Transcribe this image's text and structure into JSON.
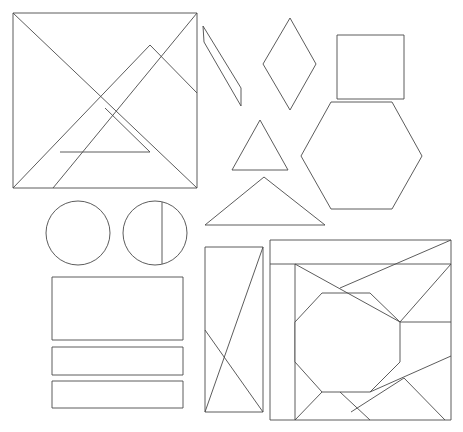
{
  "figure": {
    "width": 463,
    "height": 432,
    "background_color": "#ffffff",
    "stroke_color": "#4a4a4a",
    "stroke_color_light": "#8d8d8d",
    "stroke_width": 0.9,
    "shape_count": 13
  },
  "shapes": [
    {
      "id": "tangram-square",
      "name": "tangram-square",
      "label": "Tangram square",
      "type": "polygon-dissection",
      "outline": "13,13 197,13 197,188 13,188",
      "cuts": [
        "13,13 197,188",
        "197,13 53,188",
        "13,188 150,45",
        "150,45 197,93",
        "60,152 150,152",
        "105,108 150,152"
      ]
    },
    {
      "id": "thin-parallelogram",
      "name": "thin-parallelogram",
      "label": "Thin parallelogram",
      "type": "polygon",
      "outline": "203,26 241,88 241,106 204,42"
    },
    {
      "id": "rhombus",
      "name": "rhombus",
      "label": "Rhombus",
      "type": "polygon",
      "outline": "290,18 316,64 290,110 263,64"
    },
    {
      "id": "square",
      "name": "square",
      "label": "Square",
      "type": "polygon",
      "outline": "337,35 404,35 404,99 337,99"
    },
    {
      "id": "hexagon",
      "name": "hexagon",
      "label": "Hexagon",
      "type": "polygon",
      "outline": "331,102 392,102 422,156 392,209 331,209 301,156"
    },
    {
      "id": "small-triangle",
      "name": "small-triangle",
      "label": "Small triangle",
      "type": "polygon",
      "outline": "260,120 288,170 232,170"
    },
    {
      "id": "large-triangle",
      "name": "large-triangle",
      "label": "Large triangle",
      "type": "polygon",
      "outline": "264,177 325,225 205,225"
    },
    {
      "id": "circle-plain",
      "name": "circle-plain",
      "label": "Plain circle",
      "type": "circle",
      "cx": 78,
      "cy": 233,
      "r": 32
    },
    {
      "id": "circle-with-chord",
      "name": "circle-with-chord",
      "label": "Circle with vertical chord",
      "type": "circle",
      "cx": 155,
      "cy": 233,
      "r": 32,
      "chord": "162,202 162,264"
    },
    {
      "id": "rectangle-large",
      "name": "rectangle-large",
      "label": "Large rectangle",
      "type": "polygon",
      "outline": "52,277 183,277 183,340 52,340"
    },
    {
      "id": "rectangle-bar-top",
      "name": "rectangle-bar-top",
      "label": "Top bar rectangle",
      "type": "polygon",
      "outline": "52,347 183,347 183,375 52,375"
    },
    {
      "id": "rectangle-bar-bottom",
      "name": "rectangle-bar-bottom",
      "label": "Bottom bar rectangle",
      "type": "polygon",
      "outline": "52,381 183,381 183,408 52,408"
    },
    {
      "id": "rectangle-crossed",
      "name": "rectangle-crossed",
      "label": "Rectangle with crossed diagonals",
      "type": "polygon-dissection",
      "outline": "205,247 263,247 263,412 205,412",
      "cuts": [
        "263,247 205,412",
        "205,330 263,412"
      ]
    },
    {
      "id": "puzzle-square",
      "name": "puzzle-square",
      "label": "Dissected puzzle square with octagon",
      "type": "polygon-dissection",
      "outline": "270,240 451,240 451,420 270,420",
      "inner_frame": "270,264 451,264",
      "inner_frame_vertical": "295,264 295,420",
      "octagon": "322,293 370,293 400,322 400,362 370,392 322,392 295,362 295,322",
      "cuts": [
        "295,264 400,322",
        "400,322 451,264",
        "340,288 451,240",
        "400,322 451,322",
        "370,392 451,356",
        "370,392 404,378",
        "322,392 295,420",
        "340,392 370,420",
        "351,412 404,378",
        "404,378 445,420"
      ]
    }
  ]
}
